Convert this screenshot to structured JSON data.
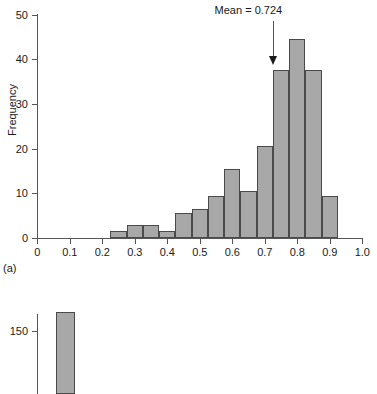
{
  "chart_data": [
    {
      "type": "bar",
      "title": "",
      "panel_label": "(a)",
      "xlabel": "",
      "ylabel": "Frequency",
      "xlim": [
        0,
        1.0
      ],
      "ylim": [
        0,
        50
      ],
      "grid": false,
      "legend": "none",
      "xticks": [
        "0",
        "0.1",
        "0.2",
        "0.3",
        "0.4",
        "0.5",
        "0.6",
        "0.7",
        "0.8",
        "0.9",
        "1.0"
      ],
      "xtick_values": [
        0,
        0.1,
        0.2,
        0.3,
        0.4,
        0.5,
        0.6,
        0.7,
        0.8,
        0.9,
        1.0
      ],
      "yticks": [
        "0",
        "10",
        "20",
        "30",
        "40",
        "50"
      ],
      "ytick_values": [
        0,
        10,
        20,
        30,
        40,
        50
      ],
      "bin_width": 0.05,
      "bin_starts": [
        0.225,
        0.275,
        0.325,
        0.375,
        0.425,
        0.475,
        0.525,
        0.575,
        0.625,
        0.675,
        0.725,
        0.775,
        0.825,
        0.875
      ],
      "categories": [
        "0.225-0.275",
        "0.275-0.325",
        "0.325-0.375",
        "0.375-0.425",
        "0.425-0.475",
        "0.475-0.525",
        "0.525-0.575",
        "0.575-0.625",
        "0.625-0.675",
        "0.675-0.725",
        "0.725-0.775",
        "0.775-0.825",
        "0.825-0.875",
        "0.875-0.925"
      ],
      "values": [
        1.5,
        3,
        3,
        1.5,
        5.5,
        6.5,
        9.5,
        15.5,
        10.5,
        20.5,
        37.5,
        44.5,
        37.5,
        9.5
      ],
      "bar_fill": "#a8a8a8",
      "bar_edge": "#4a4a4a",
      "annotations": [
        {
          "text": "Mean = 0.724",
          "x": 0.724,
          "arrow": "down-arrow-icon"
        }
      ]
    },
    {
      "type": "bar",
      "panel_label": "",
      "ylabel": "",
      "yticks": [
        "150"
      ],
      "ytick_values": [
        150
      ],
      "values": [
        175
      ],
      "bar_fill": "#a8a8a8",
      "bar_edge": "#4a4a4a",
      "note": "partially visible second histogram panel cropped at bottom of image"
    }
  ],
  "figure_a": {
    "y_axis_title": "Frequency",
    "panel_label": "(a)",
    "mean_label": "Mean = 0.724",
    "y_tick_labels": [
      "50",
      "40",
      "30",
      "20",
      "10",
      "0"
    ],
    "x_tick_labels": [
      "0",
      "0.1",
      "0.2",
      "0.3",
      "0.4",
      "0.5",
      "0.6",
      "0.7",
      "0.8",
      "0.9",
      "1.0"
    ]
  },
  "figure_b": {
    "y_tick_label": "150"
  },
  "colors": {
    "bar_fill": "#a8a8a8",
    "bar_edge": "#4a4a4a",
    "axis": "#555555",
    "text": "#1a1a1a",
    "background": "#ffffff"
  }
}
